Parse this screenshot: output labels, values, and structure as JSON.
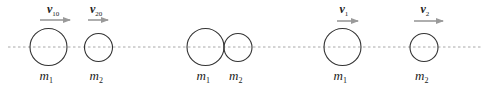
{
  "diagram": {
    "title": "",
    "colors": {
      "circle_stroke": "#333333",
      "arrow": "#9a9a9a",
      "dashed_line": "#a8a8a8",
      "text": "#222222"
    },
    "axis_line": {
      "y": 47,
      "x_start": 8,
      "x_end": 483,
      "style": "dashed"
    },
    "scenes": [
      {
        "name": "before-collision",
        "balls": [
          {
            "label_base": "m",
            "label_sub": "1",
            "cx": 48.5,
            "cy": 47,
            "r": 18.5,
            "velocity": {
              "base": "v",
              "sub": "10",
              "arrow_x1": 40,
              "arrow_x2": 70,
              "arrow_y": 20
            }
          },
          {
            "label_base": "m",
            "label_sub": "2",
            "cx": 98.5,
            "cy": 47.5,
            "r": 14,
            "velocity": {
              "base": "v",
              "sub": "20",
              "arrow_x1": 88,
              "arrow_x2": 108,
              "arrow_y": 20
            }
          }
        ]
      },
      {
        "name": "during-collision",
        "balls": [
          {
            "label_base": "m",
            "label_sub": "1",
            "cx": 205.5,
            "cy": 47,
            "r": 18.5
          },
          {
            "label_base": "m",
            "label_sub": "2",
            "cx": 238,
            "cy": 47.5,
            "r": 14
          }
        ]
      },
      {
        "name": "after-collision",
        "balls": [
          {
            "label_base": "m",
            "label_sub": "1",
            "cx": 342.5,
            "cy": 47,
            "r": 18.5,
            "velocity": {
              "base": "v",
              "sub": "1",
              "arrow_x1": 337,
              "arrow_x2": 358,
              "arrow_y": 21
            }
          },
          {
            "label_base": "m",
            "label_sub": "2",
            "cx": 424,
            "cy": 47.5,
            "r": 14,
            "velocity": {
              "base": "v",
              "sub": "2",
              "arrow_x1": 414,
              "arrow_x2": 443,
              "arrow_y": 21
            }
          }
        ]
      }
    ]
  }
}
